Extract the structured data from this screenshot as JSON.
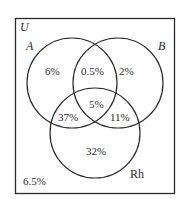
{
  "diagram": {
    "type": "venn",
    "universe_label": "U",
    "sets": [
      {
        "id": "A",
        "label": "A"
      },
      {
        "id": "B",
        "label": "B"
      },
      {
        "id": "Rh",
        "label": "Rh"
      }
    ],
    "regions": {
      "A_only": "6%",
      "A_B_only": "0.5%",
      "B_only": "2%",
      "A_B_Rh": "5%",
      "A_Rh_only": "37%",
      "B_Rh_only": "11%",
      "Rh_only": "32%",
      "none": "6.5%"
    },
    "colors": {
      "stroke": "#2a2a2a",
      "background": "#ffffff",
      "text": "#2a2a2a"
    }
  }
}
